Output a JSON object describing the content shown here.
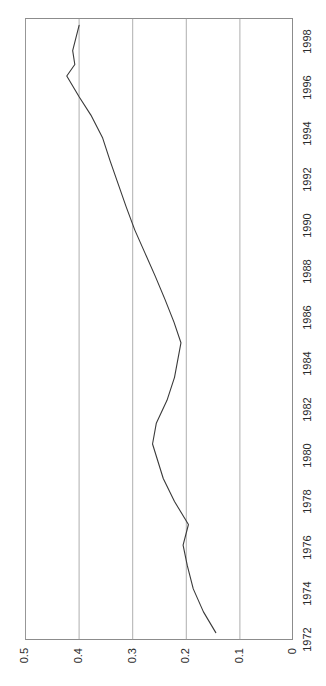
{
  "chart_data": {
    "type": "line",
    "title": "",
    "subtitle": "",
    "xlabel": "",
    "ylabel": "",
    "orientation": "rotated-90",
    "grid": true,
    "legend": "none",
    "xlim": [
      1972,
      1999
    ],
    "ylim": [
      0,
      0.5
    ],
    "x_tick_labels": [
      "1972",
      "1974",
      "1976",
      "1978",
      "1980",
      "1982",
      "1984",
      "1986",
      "1988",
      "1990",
      "1992",
      "1994",
      "1996",
      "1998"
    ],
    "x_ticks": [
      1972,
      1974,
      1976,
      1978,
      1980,
      1982,
      1984,
      1986,
      1988,
      1990,
      1992,
      1994,
      1996,
      1998
    ],
    "y_tick_labels": [
      "0",
      "0.1",
      "0.2",
      "0.3",
      "0.4",
      "0.5"
    ],
    "y_ticks": [
      0,
      0.1,
      0.2,
      0.3,
      0.4,
      0.5
    ],
    "gridline_values": [
      0.1,
      0.2,
      0.3,
      0.4,
      0.5
    ],
    "series": [
      {
        "name": "series-1",
        "color": "#3a3a3a",
        "x": [
          1972.3,
          1973.2,
          1974.2,
          1975.2,
          1976.1,
          1977.0,
          1978.0,
          1979.0,
          1980.5,
          1981.4,
          1982.4,
          1983.4,
          1984.9,
          1985.8,
          1986.8,
          1987.8,
          1988.8,
          1989.8,
          1990.8,
          1991.8,
          1992.8,
          1993.8,
          1994.8,
          1995.6,
          1996.5,
          1997.0,
          1997.6,
          1998.7
        ],
        "values": [
          0.145,
          0.168,
          0.187,
          0.198,
          0.206,
          0.196,
          0.222,
          0.243,
          0.263,
          0.256,
          0.236,
          0.222,
          0.21,
          0.223,
          0.24,
          0.258,
          0.277,
          0.296,
          0.312,
          0.327,
          0.342,
          0.356,
          0.378,
          0.4,
          0.423,
          0.408,
          0.412,
          0.4
        ]
      }
    ]
  },
  "axes": {
    "value_axis_name": "value-axis",
    "time_axis_name": "year-axis"
  }
}
